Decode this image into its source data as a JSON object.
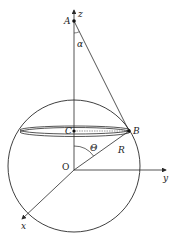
{
  "diagram": {
    "type": "sphere-geometry",
    "colors": {
      "stroke": "#2a2a2a",
      "background": "#ffffff"
    },
    "points": {
      "A": {
        "label": "A",
        "x": 74,
        "y": 21
      },
      "B": {
        "label": "B",
        "x": 129,
        "y": 131
      },
      "C": {
        "label": "C",
        "x": 74,
        "y": 131
      },
      "O": {
        "label": "O",
        "x": 74,
        "y": 170
      }
    },
    "axes": {
      "z": {
        "label": "z"
      },
      "y": {
        "label": "y"
      },
      "x": {
        "label": "x"
      }
    },
    "angles": {
      "alpha": {
        "label": "α"
      },
      "theta": {
        "label": "Θ"
      }
    },
    "segments": {
      "R": {
        "label": "R"
      }
    }
  }
}
